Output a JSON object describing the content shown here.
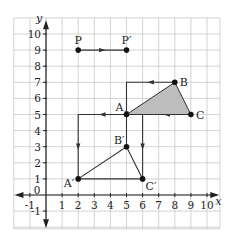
{
  "diagram": {
    "type": "coordinate-grid-translation",
    "axes": {
      "x_label": "x",
      "y_label": "y",
      "x_ticks": [
        "-1",
        "1",
        "2",
        "3",
        "4",
        "5",
        "6",
        "7",
        "8",
        "9",
        "10"
      ],
      "y_ticks": [
        "-1",
        "1",
        "2",
        "3",
        "4",
        "5",
        "6",
        "7",
        "8",
        "9",
        "10"
      ],
      "origin_label": "0",
      "x_range": [
        -2,
        10.8
      ],
      "y_range": [
        -2.2,
        11
      ]
    },
    "points": [
      {
        "name": "P",
        "label": "P",
        "x": 2,
        "y": 9
      },
      {
        "name": "P-prime",
        "label": "P′",
        "x": 5,
        "y": 9
      },
      {
        "name": "A",
        "label": "A",
        "x": 5,
        "y": 5
      },
      {
        "name": "B",
        "label": "B",
        "x": 8,
        "y": 7
      },
      {
        "name": "C",
        "label": "C",
        "x": 9,
        "y": 5
      },
      {
        "name": "A-prime",
        "label": "A′",
        "x": 2,
        "y": 1
      },
      {
        "name": "B-prime",
        "label": "B′",
        "x": 5,
        "y": 3
      },
      {
        "name": "C-prime",
        "label": "C′",
        "x": 6,
        "y": 1
      }
    ],
    "original_triangle": [
      "A",
      "B",
      "C"
    ],
    "image_triangle": [
      "A-prime",
      "B-prime",
      "C-prime"
    ],
    "translation_paths": [
      {
        "from": "P",
        "to": "P-prime",
        "via": [
          [
            2,
            9
          ],
          [
            5,
            9
          ]
        ]
      },
      {
        "from": "A",
        "to": "A-prime",
        "via": [
          [
            5,
            5
          ],
          [
            2,
            5
          ],
          [
            2,
            1
          ]
        ]
      },
      {
        "from": "B",
        "to": "B-prime",
        "via": [
          [
            8,
            7
          ],
          [
            5,
            7
          ],
          [
            5,
            3
          ]
        ]
      },
      {
        "from": "C",
        "to": "C-prime",
        "via": [
          [
            9,
            5
          ],
          [
            6,
            5
          ],
          [
            6,
            1
          ]
        ]
      }
    ],
    "colors": {
      "grid": "#c8c8c8",
      "axis": "#222222",
      "shape_fill": "#bdbdbd",
      "line": "#333333",
      "point": "#111111"
    }
  }
}
